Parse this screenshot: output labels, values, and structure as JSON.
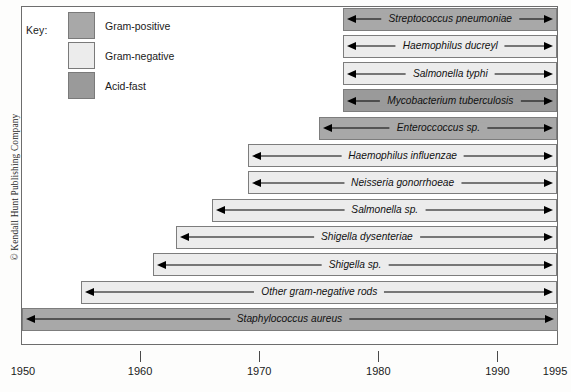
{
  "figure": {
    "copyright": "© Kendall Hunt Publishing Company",
    "frame_color": "#6d6d6d"
  },
  "legend": {
    "title": "Key:",
    "items": [
      {
        "label": "Gram-positive",
        "color": "#a8a8a8"
      },
      {
        "label": "Gram-negative",
        "color": "#ececec"
      },
      {
        "label": "Acid-fast",
        "color": "#9a9a9a"
      }
    ]
  },
  "chart_data": {
    "type": "bar",
    "title": "",
    "subtitle": "",
    "xlabel": "",
    "ylabel": "",
    "orientation": "horizontal",
    "grid": false,
    "legend_position": "top-left",
    "xlim": [
      1950,
      1995
    ],
    "x_ticks": [
      1950,
      1960,
      1970,
      1980,
      1990,
      1995
    ],
    "x_tick_labels": [
      "1950",
      "1960",
      "1970",
      "1980",
      "1990",
      "1995"
    ],
    "categories": [
      "Streptococcus pneumoniae",
      "Haemophilus ducreyl",
      "Salmonella typhi",
      "Mycobacterium tuberculosis",
      "Enteroccoccus sp.",
      "Haemophilus influenzae",
      "Neisseria gonorrhoeae",
      "Salmonella sp.",
      "Shigella dysenteriae",
      "Shigella sp.",
      "Other gram-negative rods",
      "Staphylococcus aureus"
    ],
    "series": [
      {
        "name": "Period of emerging antibiotic resistance",
        "bars": [
          {
            "label": "Streptococcus pneumoniae",
            "start": 1977,
            "end": 1995,
            "group": "Gram-positive",
            "color": "#a8a8a8"
          },
          {
            "label": "Haemophilus ducreyl",
            "start": 1977,
            "end": 1995,
            "group": "Gram-negative",
            "color": "#ececec"
          },
          {
            "label": "Salmonella typhi",
            "start": 1977,
            "end": 1995,
            "group": "Gram-negative",
            "color": "#ececec"
          },
          {
            "label": "Mycobacterium tuberculosis",
            "start": 1977,
            "end": 1995,
            "group": "Acid-fast",
            "color": "#9a9a9a"
          },
          {
            "label": "Enteroccoccus sp.",
            "start": 1975,
            "end": 1995,
            "group": "Gram-positive",
            "color": "#a8a8a8"
          },
          {
            "label": "Haemophilus influenzae",
            "start": 1969,
            "end": 1995,
            "group": "Gram-negative",
            "color": "#ececec"
          },
          {
            "label": "Neisseria gonorrhoeae",
            "start": 1969,
            "end": 1995,
            "group": "Gram-negative",
            "color": "#ececec"
          },
          {
            "label": "Salmonella sp.",
            "start": 1966,
            "end": 1995,
            "group": "Gram-negative",
            "color": "#ececec"
          },
          {
            "label": "Shigella dysenteriae",
            "start": 1963,
            "end": 1995,
            "group": "Gram-negative",
            "color": "#ececec"
          },
          {
            "label": "Shigella sp.",
            "start": 1961,
            "end": 1995,
            "group": "Gram-negative",
            "color": "#ececec"
          },
          {
            "label": "Other gram-negative rods",
            "start": 1955,
            "end": 1995,
            "group": "Gram-negative",
            "color": "#ececec"
          },
          {
            "label": "Staphylococcus aureus",
            "start": 1950,
            "end": 1995,
            "group": "Gram-positive",
            "color": "#a8a8a8"
          }
        ]
      }
    ]
  }
}
